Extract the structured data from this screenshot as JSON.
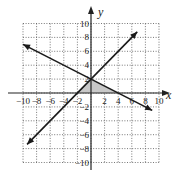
{
  "chart_data": {
    "type": "line",
    "title": "",
    "xlabel": "x",
    "ylabel": "y",
    "xlim": [
      -10,
      10
    ],
    "ylim": [
      -10,
      10
    ],
    "grid": true,
    "x_ticks": [
      "-10",
      "-8",
      "-6",
      "-4",
      "-2",
      "2",
      "4",
      "6",
      "8",
      "10"
    ],
    "y_ticks": [
      "10",
      "8",
      "6",
      "4",
      "2",
      "-2",
      "-4",
      "-6",
      "-8",
      "-10"
    ],
    "series": [
      {
        "name": "line-1",
        "equation": "y = x + 2",
        "points": [
          [
            -9.4,
            -7.4
          ],
          [
            6.8,
            8.8
          ]
        ]
      },
      {
        "name": "line-2",
        "equation": "y = -x/2 + 2",
        "points": [
          [
            -10,
            7
          ],
          [
            9,
            -2.5
          ]
        ]
      }
    ],
    "shaded_region": {
      "vertices": [
        [
          -2,
          0
        ],
        [
          0,
          2
        ],
        [
          4,
          0
        ]
      ],
      "color": "#c8c8c8"
    },
    "colors": {
      "line": "#1a1a1a",
      "grid": "#555555",
      "shade": "#c8c8c8"
    }
  }
}
